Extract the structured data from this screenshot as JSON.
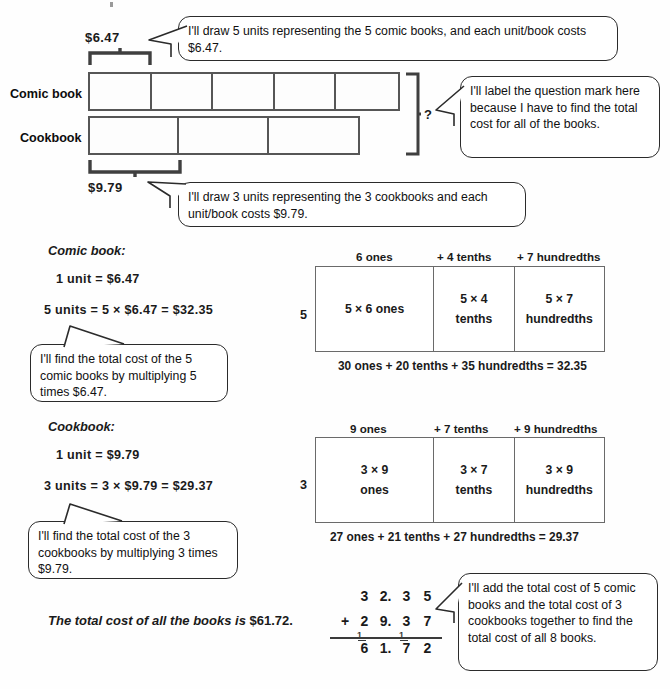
{
  "bar_model": {
    "comic_label": "Comic book",
    "cookbook_label": "Cookbook",
    "comic_unit_price": "$6.47",
    "cookbook_unit_price": "$9.79",
    "question_mark": "?",
    "comic_units": 5,
    "cookbook_units": 3
  },
  "callouts": {
    "comic_bar": "I'll draw 5 units representing the 5 comic books, and each unit/book costs $6.47.",
    "question": "I'll label the question mark here because I have to find the total cost for all of the books.",
    "cookbook_bar": "I'll draw 3 units representing the 3 cookbooks and each unit/book costs $9.79.",
    "comic_method": "I'll find the total cost of the 5 comic books by multiplying 5 times $6.47.",
    "cookbook_method": "I'll find the total cost of the 3 cookbooks by multiplying 3 times $9.79.",
    "addition_method": "I'll add the total cost of 5 comic books and the total cost of 3 cookbooks together to find the total cost of all 8 books."
  },
  "comic_section": {
    "title": "Comic book:",
    "line1": "1 unit = $6.47",
    "line2": "5 units = 5 × $6.47 = $32.35"
  },
  "cookbook_section": {
    "title": "Cookbook:",
    "line1": "1 unit = $9.79",
    "line2": "3 units = 3 × $9.79 = $29.37"
  },
  "model_comic": {
    "multiplier": "5",
    "headers": [
      "6 ones",
      "+ 4 tenths",
      "+ 7 hundredths"
    ],
    "cells": [
      {
        "top": "5 × 6 ones",
        "bottom": ""
      },
      {
        "top": "5 × 4",
        "bottom": "tenths"
      },
      {
        "top": "5 × 7",
        "bottom": "hundredths"
      }
    ],
    "footer": "30 ones  +  20 tenths + 35 hundredths = 32.35"
  },
  "model_cookbook": {
    "multiplier": "3",
    "headers": [
      "9 ones",
      "+ 7 tenths",
      "+ 9 hundredths"
    ],
    "cells": [
      {
        "top": "3 × 9",
        "bottom": "ones"
      },
      {
        "top": "3 × 7",
        "bottom": "tenths"
      },
      {
        "top": "3 × 9",
        "bottom": "hundredths"
      }
    ],
    "footer": "27 ones  +  21 tenths + 27 hundredths = 29.37"
  },
  "total_statement": {
    "phrase": "The total cost of all the books is ",
    "value": "$61.72."
  },
  "addition": {
    "addend1": [
      "3",
      "2.",
      "3",
      "5"
    ],
    "addend2": [
      "2",
      "9.",
      "3",
      "7"
    ],
    "operator": "+",
    "sum": [
      "6",
      "1.",
      "7",
      "2"
    ],
    "carries": [
      "1",
      "1"
    ]
  }
}
